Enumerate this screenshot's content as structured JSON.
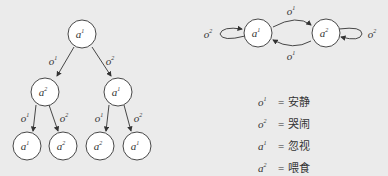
{
  "tree": {
    "root": {
      "action": "a",
      "sup": "1"
    },
    "level1": [
      {
        "edge": "o",
        "edge_sup": "1",
        "action": "a",
        "sup": "2"
      },
      {
        "edge": "o",
        "edge_sup": "2",
        "action": "a",
        "sup": "1"
      }
    ],
    "level2": [
      {
        "edge": "o",
        "edge_sup": "1",
        "action": "a",
        "sup": "1"
      },
      {
        "edge": "o",
        "edge_sup": "2",
        "action": "a",
        "sup": "2"
      },
      {
        "edge": "o",
        "edge_sup": "1",
        "action": "a",
        "sup": "2"
      },
      {
        "edge": "o",
        "edge_sup": "2",
        "action": "a",
        "sup": "1"
      }
    ]
  },
  "fsm": {
    "states": [
      {
        "label": "a",
        "sup": "1"
      },
      {
        "label": "a",
        "sup": "2"
      }
    ],
    "transitions": [
      {
        "from": "a1",
        "to": "a1",
        "label": "o",
        "sup": "2"
      },
      {
        "from": "a1",
        "to": "a2",
        "label": "o",
        "sup": "1"
      },
      {
        "from": "a2",
        "to": "a1",
        "label": "o",
        "sup": "1"
      },
      {
        "from": "a2",
        "to": "a2",
        "label": "o",
        "sup": "2"
      }
    ]
  },
  "legend": [
    {
      "sym": "o",
      "sup": "1",
      "eq": "=",
      "meaning": "安静"
    },
    {
      "sym": "o",
      "sup": "2",
      "eq": "=",
      "meaning": "哭闹"
    },
    {
      "sym": "a",
      "sup": "1",
      "eq": "=",
      "meaning": "忽视"
    },
    {
      "sym": "a",
      "sup": "2",
      "eq": "=",
      "meaning": "喂食"
    }
  ]
}
